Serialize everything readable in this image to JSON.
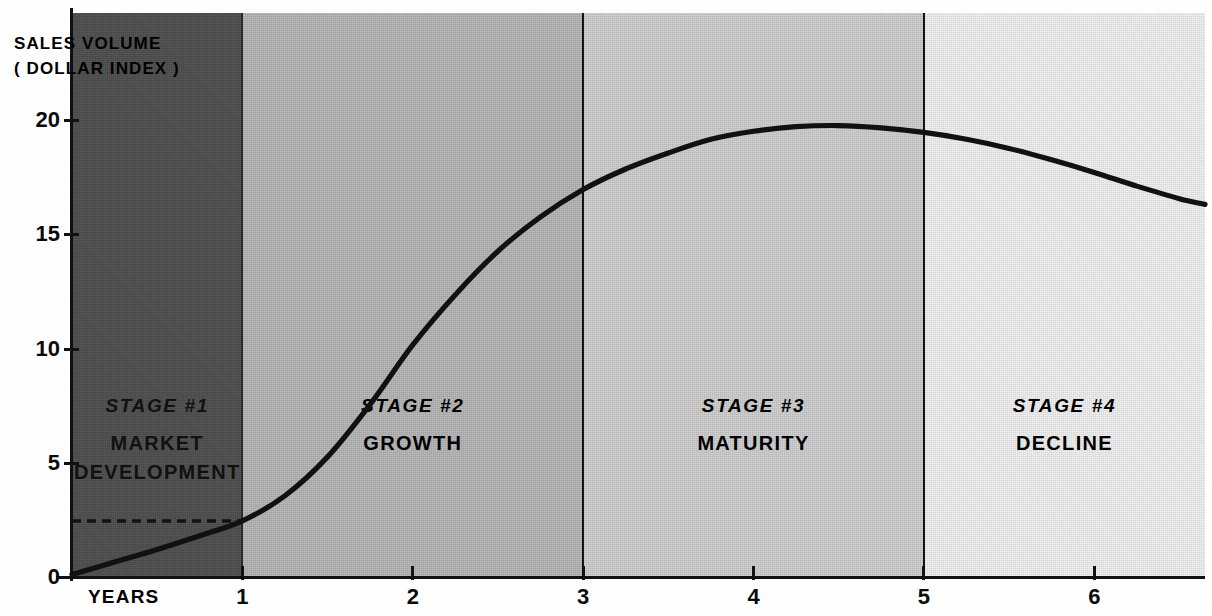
{
  "chart_data": {
    "type": "line",
    "title": "",
    "ylabel": "SALES VOLUME\n( DOLLAR INDEX )",
    "ylabel_line1": "SALES VOLUME",
    "ylabel_line2": "( DOLLAR INDEX )",
    "xlabel": "YEARS",
    "xlim": [
      0,
      6.65
    ],
    "ylim": [
      0,
      22
    ],
    "grid": false,
    "legend": "none",
    "y_ticks": [
      0,
      5,
      10,
      15,
      20
    ],
    "y_tick_labels": [
      "0",
      "5",
      "10",
      "15",
      "20"
    ],
    "x_ticks": [
      1,
      2,
      3,
      4,
      5,
      6
    ],
    "x_tick_labels": [
      "1",
      "2",
      "3",
      "4",
      "5",
      "6"
    ],
    "series": [
      {
        "name": "Sales volume",
        "x": [
          0,
          0.25,
          0.5,
          0.75,
          1.0,
          1.25,
          1.5,
          1.75,
          2.0,
          2.25,
          2.5,
          2.75,
          3.0,
          3.25,
          3.5,
          3.75,
          4.0,
          4.25,
          4.5,
          4.75,
          5.0,
          5.25,
          5.5,
          5.75,
          6.0,
          6.25,
          6.5,
          6.65
        ],
        "y": [
          0.15,
          0.7,
          1.25,
          1.85,
          2.5,
          3.6,
          5.3,
          7.6,
          10.2,
          12.4,
          14.3,
          15.8,
          17.0,
          17.9,
          18.6,
          19.2,
          19.55,
          19.75,
          19.8,
          19.7,
          19.5,
          19.2,
          18.8,
          18.3,
          17.75,
          17.15,
          16.6,
          16.35
        ]
      }
    ],
    "annotations": [
      {
        "name": "baseline-dashed",
        "type": "dashed_hline",
        "y": 2.5,
        "x_start": 0,
        "x_end": 1.0
      }
    ],
    "bands": [
      {
        "stage": "STAGE #1",
        "name_line1": "MARKET",
        "name_line2": "DEVELOPMENT",
        "x_start": 0,
        "x_end": 1.0,
        "color": "#4b4b4b"
      },
      {
        "stage": "STAGE #2",
        "name_line1": "GROWTH",
        "name_line2": "",
        "x_start": 1.0,
        "x_end": 3.0,
        "color": "#b2b2b2"
      },
      {
        "stage": "STAGE #3",
        "name_line1": "MATURITY",
        "name_line2": "",
        "x_start": 3.0,
        "x_end": 5.0,
        "color": "#cccccc"
      },
      {
        "stage": "STAGE #4",
        "name_line1": "DECLINE",
        "name_line2": "",
        "x_start": 5.0,
        "x_end": 6.65,
        "color": "#efefef"
      }
    ]
  },
  "axis": {
    "y_title_line1": "SALES VOLUME",
    "y_title_line2": "( DOLLAR INDEX )",
    "x_title": "YEARS",
    "y_labels": [
      "20",
      "15",
      "10",
      "5",
      "0"
    ],
    "x_labels": [
      "1",
      "2",
      "3",
      "4",
      "5",
      "6"
    ]
  },
  "stages": [
    {
      "number": "STAGE #1",
      "line1": "MARKET",
      "line2": "DEVELOPMENT"
    },
    {
      "number": "STAGE #2",
      "line1": "GROWTH",
      "line2": ""
    },
    {
      "number": "STAGE #3",
      "line1": "MATURITY",
      "line2": ""
    },
    {
      "number": "STAGE #4",
      "line1": "DECLINE",
      "line2": ""
    }
  ],
  "colors": {
    "band1": "#4b4b4b",
    "band2": "#b2b2b2",
    "band3": "#cccccc",
    "band4": "#efefef",
    "curve": "#111111",
    "axis": "#111111"
  }
}
